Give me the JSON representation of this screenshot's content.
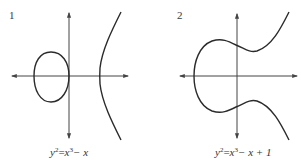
{
  "figure": {
    "colors": {
      "axis": "#444444",
      "curve": "#2b2b2b",
      "text": "#333333",
      "background": "#ffffff"
    },
    "panels": [
      {
        "label": "1",
        "equation": {
          "lhs_base": "y",
          "lhs_exp": "2",
          "eq": "=",
          "rhs_base": "x",
          "rhs_exp": "3",
          "rhs_tail": "− x"
        },
        "equation_text": "y² = x³ − x",
        "description": "Elliptic curve with two components: closed oval on the left (touching the y-axis at origin) and an unbounded branch opening to the right."
      },
      {
        "label": "2",
        "equation": {
          "lhs_base": "y",
          "lhs_exp": "2",
          "eq": "=",
          "rhs_base": "x",
          "rhs_exp": "3",
          "rhs_tail": "− x + 1"
        },
        "equation_text": "y² = x³ − x + 1",
        "description": "Elliptic curve with a single connected component that wraps around the left and extends to the upper and lower right."
      }
    ]
  }
}
